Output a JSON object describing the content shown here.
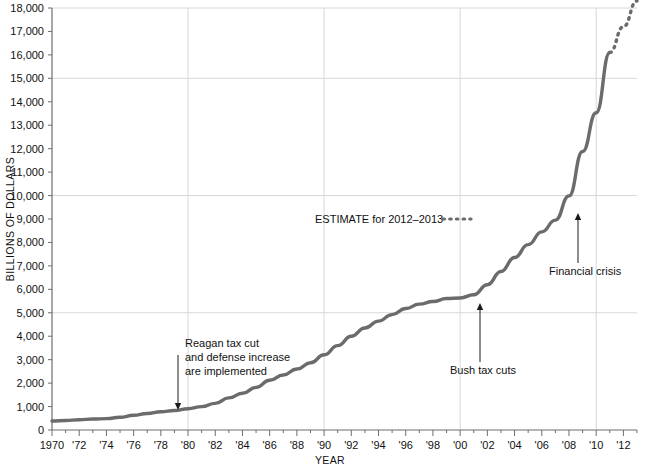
{
  "chart_data": {
    "type": "line",
    "title": "",
    "xlabel": "YEAR",
    "ylabel": "BILLIONS OF DOLLARS",
    "xlim": [
      1970,
      2013
    ],
    "ylim": [
      0,
      18000
    ],
    "ytick_step": 1000,
    "grid": "horizontal gridlines every 5000; vertical gridlines every 10 years",
    "legend_position": "inside-center-right",
    "ytick_labels": [
      "0",
      "1,000",
      "2,000",
      "3,000",
      "4,000",
      "5,000",
      "6,000",
      "7,000",
      "8,000",
      "9,000",
      "10,000",
      "11,000",
      "12,000",
      "13,000",
      "14,000",
      "15,000",
      "16,000",
      "17,000",
      "18,000"
    ],
    "ytick_values": [
      0,
      1000,
      2000,
      3000,
      4000,
      5000,
      6000,
      7000,
      8000,
      9000,
      10000,
      11000,
      12000,
      13000,
      14000,
      15000,
      16000,
      17000,
      18000
    ],
    "xtick_labels": [
      "1970",
      "'72",
      "'74",
      "'76",
      "'78",
      "'80",
      "'82",
      "'84",
      "'86",
      "'88",
      "'90",
      "'92",
      "'94",
      "'96",
      "'98",
      "'00",
      "'02",
      "'04",
      "'06",
      "'08",
      "'10",
      "'12"
    ],
    "xtick_values": [
      1970,
      1972,
      1974,
      1976,
      1978,
      1980,
      1982,
      1984,
      1986,
      1988,
      1990,
      1992,
      1994,
      1996,
      1998,
      2000,
      2002,
      2004,
      2006,
      2008,
      2010,
      2012
    ],
    "gridline_y_values": [
      5000,
      10000,
      15000
    ],
    "gridline_x_values": [
      1980,
      1990,
      2000,
      2010
    ],
    "series": [
      {
        "name": "National debt (actual)",
        "style": "solid",
        "color": "#6b6b6b",
        "x": [
          1970,
          1971,
          1972,
          1973,
          1974,
          1975,
          1976,
          1977,
          1978,
          1979,
          1980,
          1981,
          1982,
          1983,
          1984,
          1985,
          1986,
          1987,
          1988,
          1989,
          1990,
          1991,
          1992,
          1993,
          1994,
          1995,
          1996,
          1997,
          1998,
          1999,
          2000,
          2001,
          2002,
          2003,
          2004,
          2005,
          2006,
          2007,
          2008,
          2009,
          2010,
          2011
        ],
        "values": [
          381,
          408,
          436,
          466,
          484,
          542,
          629,
          706,
          777,
          829,
          909,
          995,
          1137,
          1372,
          1565,
          1818,
          2121,
          2346,
          2601,
          2868,
          3207,
          3598,
          4002,
          4351,
          4644,
          4921,
          5181,
          5369,
          5478,
          5606,
          5629,
          5770,
          6198,
          6760,
          7355,
          7905,
          8451,
          8951,
          9986,
          11876,
          13529,
          16100
        ]
      },
      {
        "name": "ESTIMATE for 2012-2013",
        "style": "dotted",
        "color": "#6b6b6b",
        "x": [
          2011,
          2012,
          2013
        ],
        "values": [
          16100,
          17200,
          18300
        ]
      }
    ],
    "annotations": [
      {
        "id": "reagan",
        "lines": [
          "Reagan tax cut",
          "and defense increase",
          "are implemented"
        ],
        "x": 1982,
        "y": 1137,
        "arrow": "down"
      },
      {
        "id": "bush",
        "lines": [
          "Bush tax cuts"
        ],
        "x": 2001,
        "y": 5770,
        "arrow": "up"
      },
      {
        "id": "financial-crisis",
        "lines": [
          "Financial crisis"
        ],
        "x": 2008,
        "y": 9986,
        "arrow": "up"
      }
    ],
    "legend": {
      "label": "ESTIMATE for 2012–2013",
      "swatch": "dotted"
    }
  }
}
